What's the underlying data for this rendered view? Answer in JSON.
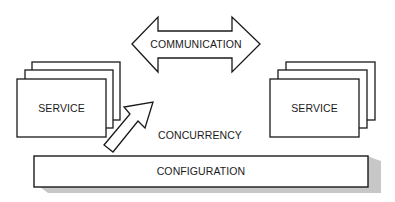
{
  "diagram": {
    "communication_arrow": {
      "label": "COMMUNICATION",
      "direction": "bidirectional"
    },
    "left_service": {
      "label": "SERVICE",
      "stack_count": 3
    },
    "right_service": {
      "label": "SERVICE",
      "stack_count": 3
    },
    "concurrency_arrow": {
      "label": "CONCURRENCY",
      "direction": "up-right"
    },
    "configuration_bar": {
      "label": "CONFIGURATION"
    },
    "colors": {
      "stroke": "#1a1a1a",
      "fill": "#ffffff",
      "shadow": "#b8b8b8"
    }
  }
}
